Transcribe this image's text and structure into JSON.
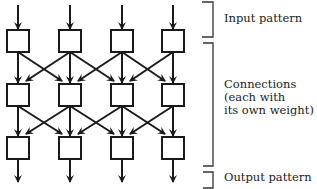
{
  "diagram": {
    "type": "neural-network-layers",
    "columns": 4,
    "layers": 3,
    "labels": {
      "input": "Input pattern",
      "connections_line1": "Connections",
      "connections_line2": "(each with",
      "connections_line3": "its own weight)",
      "output": "Output pattern"
    },
    "colors": {
      "stroke": "#1a1a1a",
      "background": "#ffffff"
    }
  }
}
